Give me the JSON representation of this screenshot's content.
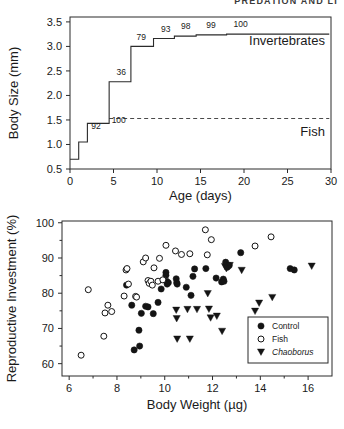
{
  "header": {
    "running_head": "PREDATION AND LI"
  },
  "figure": {
    "panel_a_name": "size-refuge-step-plot",
    "panel_b_name": "reproductive-investment-scatter"
  },
  "chart_data": [
    {
      "type": "line",
      "title": "",
      "subtype": "step",
      "xlabel": "Age (days)",
      "ylabel": "Body Size (mm)",
      "xlim": [
        0,
        30
      ],
      "ylim": [
        0.5,
        3.6
      ],
      "xticks": [
        0,
        5,
        10,
        15,
        20,
        25,
        30
      ],
      "xticklabels": [
        "0",
        "5",
        "10",
        "15",
        "20",
        "25",
        "30"
      ],
      "yticks": [
        0.5,
        1.0,
        1.5,
        2.0,
        2.5,
        3.0,
        3.5
      ],
      "yticklabels": [
        "0.5",
        "1.0",
        "1.5",
        "2.0",
        "2.5",
        "3.0",
        "3.5"
      ],
      "grid": false,
      "legend_position": "inline-right",
      "series": [
        {
          "name": "Body size at age (step)",
          "x": [
            0,
            1,
            1,
            2,
            2,
            4.5,
            4.5,
            7,
            7,
            9.6,
            9.6,
            12,
            12,
            14.5,
            14.5,
            18,
            18,
            29.8
          ],
          "y": [
            0.7,
            0.7,
            1.05,
            1.05,
            1.43,
            1.43,
            2.28,
            2.28,
            3.0,
            3.0,
            3.16,
            3.16,
            3.21,
            3.21,
            3.235,
            3.235,
            3.25,
            3.25
          ]
        },
        {
          "name": "Fish size threshold",
          "style": "dashed",
          "x": [
            4.5,
            29.8
          ],
          "y": [
            1.53,
            1.53
          ]
        }
      ],
      "annotations": [
        {
          "text": "92",
          "x": 3.0,
          "y": 1.32
        },
        {
          "text": "100",
          "x": 5.6,
          "y": 1.43
        },
        {
          "text": "36",
          "x": 5.9,
          "y": 2.42
        },
        {
          "text": "79",
          "x": 8.2,
          "y": 3.13
        },
        {
          "text": "93",
          "x": 11.0,
          "y": 3.3
        },
        {
          "text": "98",
          "x": 13.3,
          "y": 3.36
        },
        {
          "text": "99",
          "x": 16.2,
          "y": 3.37
        },
        {
          "text": "100",
          "x": 19.6,
          "y": 3.4
        }
      ],
      "inline_labels": [
        {
          "text": "Invertebrates",
          "x": 29.3,
          "y": 3.03,
          "anchor": "end"
        },
        {
          "text": "Fish",
          "x": 29.3,
          "y": 1.18,
          "anchor": "end"
        }
      ]
    },
    {
      "type": "scatter",
      "title": "",
      "xlabel": "Body Weight (µg)",
      "ylabel": "Reproductive Investment (%)",
      "xlim": [
        5.7,
        17.0
      ],
      "ylim": [
        56.5,
        100.5
      ],
      "xticks": [
        6,
        8,
        10,
        12,
        14,
        16
      ],
      "xticklabels": [
        "6",
        "8",
        "10",
        "12",
        "14",
        "16"
      ],
      "yticks": [
        60,
        70,
        80,
        90,
        100
      ],
      "yticklabels": [
        "60",
        "70",
        "80",
        "90",
        "100"
      ],
      "grid": false,
      "legend_position": "lower-right",
      "legend_entries": [
        {
          "label": "Control",
          "marker": "filled-circle",
          "italic": false
        },
        {
          "label": "Fish",
          "marker": "open-circle",
          "italic": false
        },
        {
          "label": "Chaoborus",
          "marker": "filled-triangle-down",
          "italic": true
        }
      ],
      "series": [
        {
          "name": "Control",
          "marker": "filled-circle",
          "color": "#141414",
          "points": [
            [
              8.4,
              82.3
            ],
            [
              8.62,
              76.6
            ],
            [
              8.72,
              63.9
            ],
            [
              8.95,
              65.0
            ],
            [
              8.92,
              69.5
            ],
            [
              9.02,
              74.3
            ],
            [
              9.2,
              76.3
            ],
            [
              9.3,
              76.1
            ],
            [
              9.52,
              74.2
            ],
            [
              9.72,
              77.4
            ],
            [
              9.85,
              81.2
            ],
            [
              10.05,
              85.9
            ],
            [
              10.05,
              85.1
            ],
            [
              10.08,
              83.4
            ],
            [
              10.1,
              82.6
            ],
            [
              10.15,
              83.0
            ],
            [
              10.48,
              84.1
            ],
            [
              10.5,
              83.0
            ],
            [
              10.52,
              82.6
            ],
            [
              10.9,
              81.7
            ],
            [
              11.1,
              79.4
            ],
            [
              11.18,
              84.8
            ],
            [
              11.25,
              86.9
            ],
            [
              11.72,
              87.0
            ],
            [
              12.15,
              84.3
            ],
            [
              12.38,
              83.2
            ],
            [
              12.45,
              84.0
            ],
            [
              12.48,
              83.4
            ],
            [
              12.55,
              88.8
            ],
            [
              12.62,
              87.4
            ],
            [
              12.7,
              87.9
            ],
            [
              13.18,
              91.5
            ],
            [
              15.25,
              87.0
            ],
            [
              15.42,
              86.6
            ]
          ]
        },
        {
          "name": "Fish",
          "marker": "open-circle",
          "color": "#ffffff",
          "points": [
            [
              6.5,
              62.4
            ],
            [
              6.8,
              81.0
            ],
            [
              7.45,
              67.8
            ],
            [
              7.5,
              74.4
            ],
            [
              7.62,
              76.6
            ],
            [
              7.78,
              74.8
            ],
            [
              8.3,
              79.2
            ],
            [
              8.38,
              86.6
            ],
            [
              8.42,
              87.0
            ],
            [
              8.48,
              82.6
            ],
            [
              8.78,
              79.1
            ],
            [
              8.82,
              78.9
            ],
            [
              9.1,
              88.9
            ],
            [
              9.2,
              90.0
            ],
            [
              9.3,
              83.6
            ],
            [
              9.35,
              82.8
            ],
            [
              9.42,
              83.4
            ],
            [
              9.48,
              82.3
            ],
            [
              9.55,
              87.2
            ],
            [
              9.72,
              83.4
            ],
            [
              9.78,
              89.9
            ],
            [
              9.92,
              83.8
            ],
            [
              10.05,
              93.6
            ],
            [
              10.45,
              92.0
            ],
            [
              10.7,
              91.0
            ],
            [
              11.05,
              91.2
            ],
            [
              11.7,
              98.0
            ],
            [
              11.78,
              90.9
            ],
            [
              11.95,
              95.2
            ],
            [
              13.78,
              93.4
            ],
            [
              14.45,
              96.0
            ]
          ]
        },
        {
          "name": "Chaoborus",
          "marker": "filled-triangle-down",
          "color": "#141414",
          "points": [
            [
              10.48,
              75.2
            ],
            [
              10.5,
              72.8
            ],
            [
              10.52,
              67.0
            ],
            [
              10.95,
              75.4
            ],
            [
              11.05,
              67.0
            ],
            [
              11.35,
              75.4
            ],
            [
              11.8,
              79.9
            ],
            [
              11.85,
              75.5
            ],
            [
              11.92,
              73.0
            ],
            [
              12.18,
              73.5
            ],
            [
              12.4,
              69.2
            ],
            [
              12.52,
              87.6
            ],
            [
              12.58,
              87.0
            ],
            [
              12.72,
              87.9
            ],
            [
              13.22,
              86.5
            ],
            [
              13.78,
              74.9
            ],
            [
              13.95,
              77.2
            ],
            [
              14.5,
              78.8
            ],
            [
              16.15,
              87.7
            ]
          ]
        }
      ]
    }
  ]
}
